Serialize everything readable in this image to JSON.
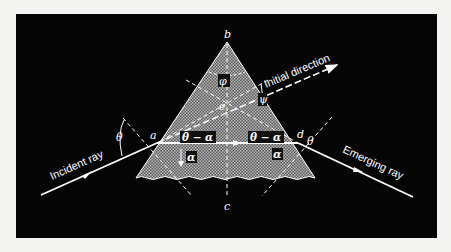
{
  "figure": {
    "background_color": "#f4f4f2",
    "panel_color": "#050505",
    "prism_fill": "#8a8a8a",
    "line_color": "#ffffff",
    "labels": {
      "apex": "b",
      "base": "c",
      "center": "e",
      "entry_point": "a",
      "exit_point": "d",
      "apex_angle": "φ",
      "deviation_angle": "ψ",
      "incidence_angle_left": "θ",
      "incidence_angle_right": "θ",
      "inner_angle_left": "θ − α",
      "inner_angle_right": "θ − α",
      "refraction_angle_left": "α",
      "refraction_angle_right": "α",
      "alpha_at_a": "α"
    },
    "rays": {
      "incident": "Incident ray",
      "emerging": "Emerging ray",
      "initial": "Initial direction"
    }
  }
}
